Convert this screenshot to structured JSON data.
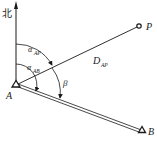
{
  "diagram": {
    "north_label": "北",
    "points": {
      "A": {
        "label": "A",
        "x": 16,
        "y": 85
      },
      "B": {
        "label": "B",
        "x": 142,
        "y": 131
      },
      "P": {
        "label": "P",
        "x": 139,
        "y": 26
      }
    },
    "angles": {
      "alpha_AP": {
        "symbol": "α",
        "sub": "AP"
      },
      "alpha_AB": {
        "symbol": "α",
        "sub": "AB"
      },
      "beta": {
        "symbol": "β"
      }
    },
    "distance": {
      "symbol": "D",
      "sub": "AP"
    },
    "colors": {
      "stroke": "#1a1a1a",
      "background": "#ffffff"
    }
  }
}
